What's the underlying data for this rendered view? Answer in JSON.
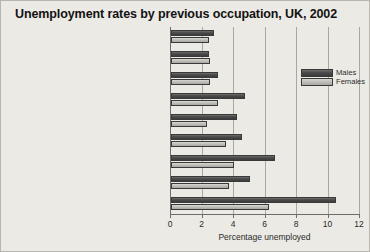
{
  "chart_data": {
    "type": "bar",
    "orientation": "horizontal",
    "title": "Unemployment rates by previous occupation, UK, 2002",
    "xlabel": "Percentage unemployed",
    "ylabel": "",
    "xlim": [
      0,
      12
    ],
    "xticks": [
      0,
      2,
      4,
      6,
      8,
      10,
      12
    ],
    "xtick_labels": [
      "0",
      "2",
      "4",
      "6",
      "8",
      "10",
      "12"
    ],
    "grid": true,
    "legend_position": "inside-right",
    "categories": [
      "Managers and senior officials",
      "Professional occupations",
      "Associate professional and technical",
      "Administrative and secretarial",
      "Skilled trades",
      "Personal service",
      "Sales and customer service",
      "Process, plant and machine operatives",
      "Elementary occupations"
    ],
    "series": [
      {
        "name": "Males",
        "color": "#4a4a4a",
        "values": [
          2.7,
          2.4,
          3.0,
          4.7,
          4.2,
          4.5,
          6.6,
          5.0,
          10.5
        ]
      },
      {
        "name": "Females",
        "color": "#bdbbb6",
        "values": [
          2.4,
          2.5,
          2.5,
          3.0,
          2.3,
          3.5,
          4.0,
          3.7,
          6.2
        ]
      }
    ]
  },
  "legend": {
    "entries": [
      {
        "label": "Males"
      },
      {
        "label": "Females"
      }
    ]
  }
}
